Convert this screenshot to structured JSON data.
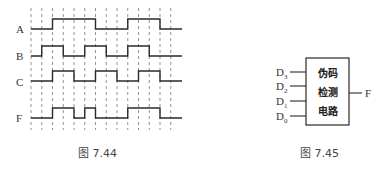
{
  "figure_744": {
    "caption": "图 7.44",
    "signals": [
      {
        "name": "A",
        "label": "A"
      },
      {
        "name": "B",
        "label": "B"
      },
      {
        "name": "C",
        "label": "C"
      },
      {
        "name": "F",
        "label": "F"
      }
    ],
    "timing": {
      "grid_lines": 14,
      "intervals": 13,
      "levels": {
        "A": [
          0,
          0,
          1,
          1,
          1,
          1,
          0,
          0,
          0,
          1,
          1,
          1,
          0
        ],
        "B": [
          0,
          1,
          1,
          0,
          0,
          1,
          1,
          0,
          0,
          1,
          1,
          0,
          0
        ],
        "C": [
          0,
          0,
          1,
          1,
          0,
          0,
          1,
          1,
          0,
          0,
          1,
          1,
          0
        ],
        "F": [
          0,
          0,
          1,
          1,
          0,
          1,
          0,
          0,
          0,
          1,
          1,
          1,
          0
        ]
      }
    }
  },
  "figure_745": {
    "caption": "图 7.45",
    "block_lines": [
      "伪码",
      "检测",
      "电路"
    ],
    "inputs": [
      {
        "main": "D",
        "sub": "3"
      },
      {
        "main": "D",
        "sub": "2"
      },
      {
        "main": "D",
        "sub": "1"
      },
      {
        "main": "D",
        "sub": "0"
      }
    ],
    "output": "F"
  },
  "colors": {
    "line": "#2a2a2a",
    "grid": "#777777",
    "background": "#ffffff"
  }
}
